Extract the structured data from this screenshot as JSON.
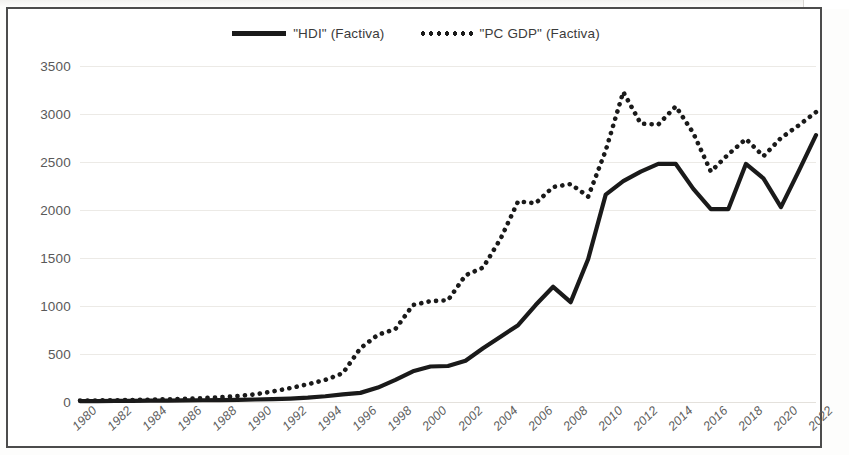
{
  "chart_data": {
    "type": "line",
    "title": "",
    "subtitle": "",
    "xlabel": "",
    "ylabel": "",
    "grid": true,
    "legend_position": "top-center",
    "xlim": [
      1980,
      2022
    ],
    "ylim": [
      0,
      3500
    ],
    "y_ticks": [
      3500,
      3000,
      2500,
      2000,
      1500,
      1000,
      500,
      0
    ],
    "x_tick_labels": [
      "1980",
      "1982",
      "1984",
      "1986",
      "1988",
      "1990",
      "1992",
      "1994",
      "1996",
      "1998",
      "2000",
      "2002",
      "2004",
      "2006",
      "2008",
      "2010",
      "2012",
      "2014",
      "2016",
      "2018",
      "2020",
      "2022"
    ],
    "x": [
      1980,
      1981,
      1982,
      1983,
      1984,
      1985,
      1986,
      1987,
      1988,
      1989,
      1990,
      1991,
      1992,
      1993,
      1994,
      1995,
      1996,
      1997,
      1998,
      1999,
      2000,
      2001,
      2002,
      2003,
      2004,
      2005,
      2006,
      2007,
      2008,
      2009,
      2010,
      2011,
      2012,
      2013,
      2014,
      2015,
      2016,
      2017,
      2018,
      2019,
      2020,
      2021,
      2022
    ],
    "series": [
      {
        "name": "\"HDI\" (Factiva)",
        "style": "solid",
        "color": "#1a1a1a",
        "values": [
          10,
          10,
          12,
          12,
          14,
          14,
          16,
          18,
          20,
          22,
          26,
          30,
          36,
          45,
          60,
          80,
          95,
          150,
          230,
          320,
          370,
          375,
          430,
          560,
          680,
          800,
          1010,
          1200,
          1040,
          1490,
          2160,
          2300,
          2400,
          2480,
          2480,
          2220,
          2010,
          2010,
          2480,
          2330,
          2030,
          2400,
          2780
        ]
      },
      {
        "name": "\"PC GDP\" (Factiva)",
        "style": "dotted",
        "color": "#1a1a1a",
        "values": [
          15,
          16,
          18,
          20,
          24,
          28,
          34,
          40,
          50,
          62,
          80,
          110,
          145,
          185,
          230,
          300,
          560,
          700,
          760,
          1010,
          1050,
          1060,
          1320,
          1400,
          1700,
          2090,
          2070,
          2240,
          2270,
          2140,
          2620,
          3230,
          2900,
          2890,
          3080,
          2800,
          2400,
          2580,
          2740,
          2560,
          2750,
          2880,
          3020
        ]
      }
    ],
    "legend": [
      {
        "label": "\"HDI\" (Factiva)",
        "style": "solid"
      },
      {
        "label": "\"PC GDP\" (Factiva)",
        "style": "dotted"
      }
    ]
  }
}
